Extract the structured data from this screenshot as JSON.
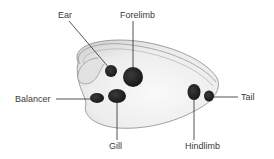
{
  "diagram": {
    "labels": {
      "ear": "Ear",
      "forelimb": "Forelimb",
      "balancer": "Balancer",
      "gill": "Gill",
      "hindlimb": "Hindlimb",
      "tail": "Tail"
    },
    "colors": {
      "body_fill": "#eeeeee",
      "body_outline": "#8a8a8a",
      "dot": "#1e1e1e",
      "leader_line": "#2a2a2a",
      "label_text": "#3a3a3a"
    }
  }
}
